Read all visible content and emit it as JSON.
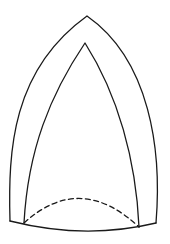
{
  "figure": {
    "type": "line-drawing",
    "colors": {
      "stroke": "#1a1a1a",
      "background": "#ffffff"
    },
    "shapes": {
      "outer_arch": {
        "apex": [
          87,
          16
        ],
        "left_base": [
          10,
          221
        ],
        "right_base": [
          156,
          223
        ],
        "style": "solid"
      },
      "inner_arch": {
        "apex": [
          85,
          43
        ],
        "left_base": [
          24,
          223
        ],
        "right_base": [
          139,
          227
        ],
        "style": "solid"
      },
      "base_curve": {
        "from": [
          10,
          221
        ],
        "to": [
          156,
          223
        ],
        "sag_y": 232,
        "style": "solid"
      },
      "dashed_curve": {
        "from": [
          24,
          223
        ],
        "to": [
          139,
          227
        ],
        "peak_y": 196,
        "style": "dashed"
      }
    }
  },
  "caption": {
    "text": ""
  }
}
